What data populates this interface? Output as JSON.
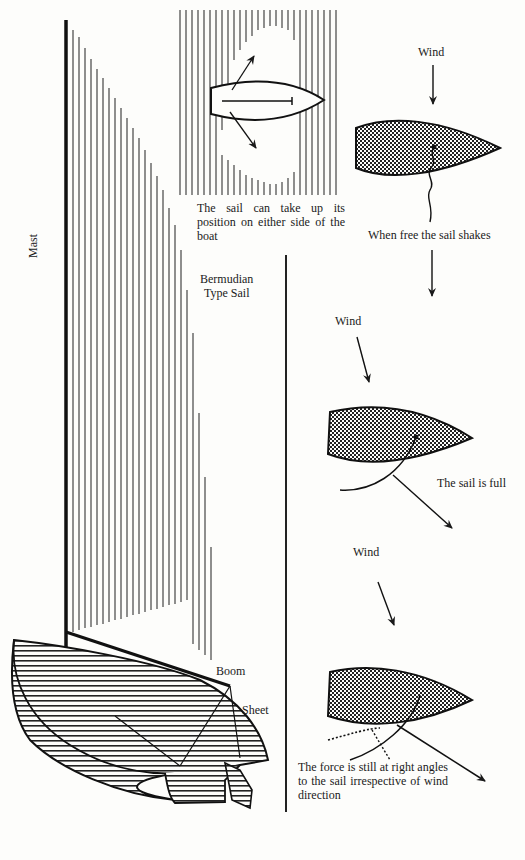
{
  "figure": {
    "colors": {
      "ink": "#1a1a1a",
      "paper": "#fdfdfb"
    }
  },
  "rig": {
    "mast_label": "Mast",
    "sail_label_line1": "Bermudian",
    "sail_label_line2": "Type Sail",
    "boom_label": "Boom",
    "sheet_label": "Sheet"
  },
  "top_plan": {
    "caption": "The sail can take up its position on either side of the boat"
  },
  "diagrams": [
    {
      "wind_label": "Wind",
      "caption": "When free the sail shakes"
    },
    {
      "wind_label": "Wind",
      "caption": "The sail is full"
    },
    {
      "wind_label": "Wind",
      "caption": "The force is still at right angles to the sail irrespective of wind direction"
    }
  ]
}
